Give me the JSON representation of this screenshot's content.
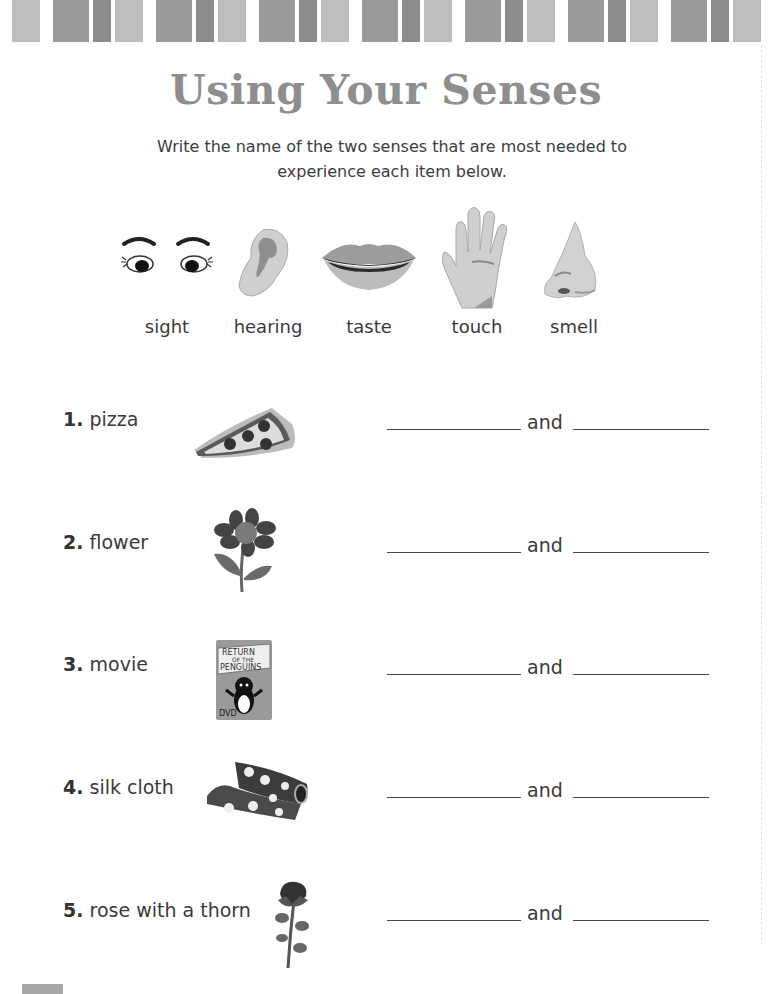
{
  "worksheet": {
    "title": "Using Your Senses",
    "instructions": "Write the name of the two senses that are most needed to experience each item below."
  },
  "senses": [
    {
      "label": "sight",
      "icon": "eyes-icon"
    },
    {
      "label": "hearing",
      "icon": "ear-icon"
    },
    {
      "label": "taste",
      "icon": "mouth-icon"
    },
    {
      "label": "touch",
      "icon": "hand-icon"
    },
    {
      "label": "smell",
      "icon": "nose-icon"
    }
  ],
  "items": [
    {
      "number": "1.",
      "label": "pizza",
      "icon": "pizza-slice-icon",
      "connector": "and",
      "answer1": "",
      "answer2": ""
    },
    {
      "number": "2.",
      "label": "flower",
      "icon": "flower-icon",
      "connector": "and",
      "answer1": "",
      "answer2": ""
    },
    {
      "number": "3.",
      "label": "movie",
      "icon": "dvd-case-icon",
      "connector": "and",
      "answer1": "",
      "answer2": ""
    },
    {
      "number": "4.",
      "label": "silk cloth",
      "icon": "silk-cloth-icon",
      "connector": "and",
      "answer1": "",
      "answer2": ""
    },
    {
      "number": "5.",
      "label": "rose with a thorn",
      "icon": "rose-icon",
      "connector": "and",
      "answer1": "",
      "answer2": ""
    }
  ],
  "dvd_cover": {
    "title_line1": "RETURN",
    "title_line2": "OF THE",
    "title_line3": "PENGUINS",
    "format": "DVD"
  },
  "colors": {
    "title": "#8e8e8e",
    "stripe_medium": "#9a9a9a",
    "stripe_dark": "#8c8c8c",
    "stripe_light": "#bdbdbd"
  }
}
